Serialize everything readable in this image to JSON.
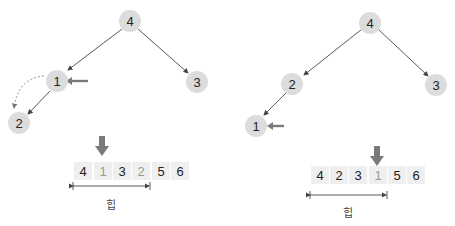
{
  "left_panel": {
    "tree": {
      "root": "4",
      "left_child": "1",
      "right_child": "3",
      "left_left_child": "2"
    },
    "array": [
      "4",
      "1",
      "3",
      "2",
      "5",
      "6"
    ],
    "highlighted_index": 1,
    "heap_label": "힙"
  },
  "right_panel": {
    "tree": {
      "root": "4",
      "left_child": "2",
      "right_child": "3",
      "left_left_child": "1"
    },
    "array": [
      "4",
      "2",
      "3",
      "1",
      "5",
      "6"
    ],
    "highlighted_index": 3,
    "heap_label": "힙"
  },
  "colors": {
    "node_fill": "#dcdcdc",
    "cell_fill": "#efefef",
    "arrow": "#7a7a7a",
    "edge": "#444444"
  }
}
